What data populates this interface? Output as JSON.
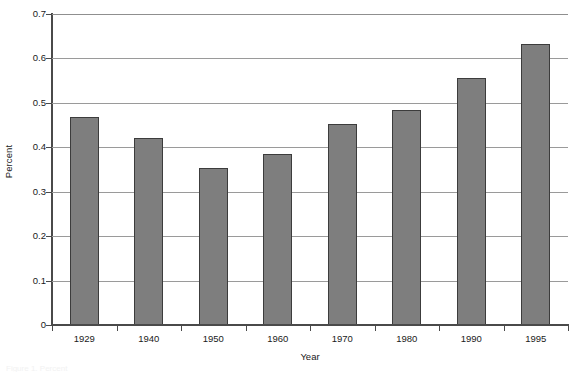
{
  "chart_data": {
    "type": "bar",
    "title": "",
    "xlabel": "Year",
    "ylabel": "Percent",
    "categories": [
      "1929",
      "1940",
      "1950",
      "1960",
      "1970",
      "1980",
      "1990",
      "1995"
    ],
    "values": [
      0.468,
      0.42,
      0.353,
      0.386,
      0.452,
      0.485,
      0.556,
      0.633
    ],
    "series": [
      {
        "name": "Percent",
        "values": [
          0.468,
          0.42,
          0.353,
          0.386,
          0.452,
          0.485,
          0.556,
          0.633
        ]
      }
    ],
    "ylim": [
      0,
      0.7
    ],
    "ytick_values": [
      0,
      0.1,
      0.2,
      0.3,
      0.4,
      0.5,
      0.6,
      0.7
    ],
    "ytick_labels": [
      "0",
      "0.1",
      "0.2",
      "0.3",
      "0.4",
      "0.5",
      "0.6",
      "0.7"
    ],
    "grid": "horizontal",
    "legend": "none",
    "bar_color": "#7e7e7e",
    "bar_edge_color": "#3c3c3c",
    "gridline_color": "#9a9a9a",
    "axis_color": "#4a4a4a"
  },
  "caption": {
    "text": "Figure 1. Percent"
  }
}
